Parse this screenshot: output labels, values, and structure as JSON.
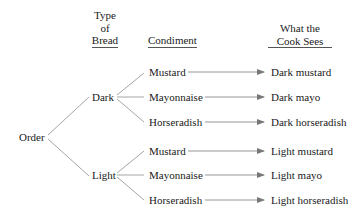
{
  "headers": {
    "bread": [
      "Type",
      "of",
      "Bread"
    ],
    "condiment": "Condiment",
    "result": [
      "What the",
      "Cook Sees"
    ]
  },
  "root": "Order",
  "breads": [
    {
      "label": "Dark",
      "condiments": [
        {
          "label": "Mustard",
          "result": "Dark mustard"
        },
        {
          "label": "Mayonnaise",
          "result": "Dark mayo"
        },
        {
          "label": "Horseradish",
          "result": "Dark horseradish"
        }
      ]
    },
    {
      "label": "Light",
      "condiments": [
        {
          "label": "Mustard",
          "result": "Light mustard"
        },
        {
          "label": "Mayonnaise",
          "result": "Light mayo"
        },
        {
          "label": "Horseradish",
          "result": "Light horseradish"
        }
      ]
    }
  ],
  "colors": {
    "line": "#9a9a9a",
    "text": "#1a1a1a"
  }
}
